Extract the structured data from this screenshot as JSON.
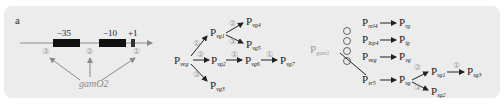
{
  "panel_label": "a",
  "promoter": {
    "elements": [
      {
        "label": "−35"
      },
      {
        "label": "−10"
      },
      {
        "label": "+1"
      }
    ],
    "sites": [
      "③",
      "②",
      "①"
    ],
    "regulator": "gamO2"
  },
  "cascade": {
    "root": {
      "main": "P",
      "sub": "veg"
    },
    "nodes": [
      {
        "id": "vg1",
        "main": "P",
        "sub": "vg1"
      },
      {
        "id": "vg2",
        "main": "P",
        "sub": "vg2"
      },
      {
        "id": "vg3",
        "main": "P",
        "sub": "vg3"
      },
      {
        "id": "vg4",
        "main": "P",
        "sub": "vg4"
      },
      {
        "id": "vg5",
        "main": "P",
        "sub": "vg5"
      },
      {
        "id": "vg6",
        "main": "P",
        "sub": "vg6"
      },
      {
        "id": "vg7",
        "main": "P",
        "sub": "vg7"
      }
    ],
    "edge_labels": {
      "veg_vg1": "①",
      "veg_vg2": "②",
      "veg_vg3": "③",
      "vg1_vg4": "②",
      "vg1_vg5": "③",
      "vg2_vg6": "①",
      "vg6_vg7": "①"
    }
  },
  "combo": {
    "source": {
      "main": "P",
      "sub": "gam1"
    },
    "operator": "⊕",
    "rows": [
      {
        "from_main": "P",
        "from_sub": "rel4",
        "to_main": "P",
        "to_sub": "rg"
      },
      {
        "from_main": "P",
        "from_sub": "lep4",
        "to_main": "P",
        "to_sub": "lg"
      },
      {
        "from_main": "P",
        "from_sub": "veg",
        "to_main": "P",
        "to_sub": "vg"
      },
      {
        "from_main": "P",
        "from_sub": "sr5",
        "to_main": "P",
        "to_sub": "sg"
      }
    ],
    "branches": [
      {
        "main": "P",
        "sub": "sg1"
      },
      {
        "main": "P",
        "sub": "sg2"
      },
      {
        "main": "P",
        "sub": "sg3"
      }
    ],
    "edge_labels": {
      "sg_sg1": "②",
      "sg_sg2": "③",
      "sg1_sg3": "①"
    }
  }
}
